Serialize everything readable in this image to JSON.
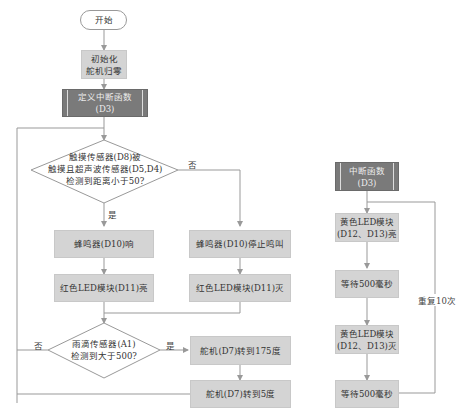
{
  "main_flow": {
    "start": "开始",
    "init": [
      "初始化",
      "舵机归零"
    ],
    "define_interrupt": [
      "定义中断函数",
      "(D3)"
    ],
    "decision1": [
      "触摸传感器(D8)被",
      "触摸且超声波传感器(D5,D4)",
      "检测到距离小于50?"
    ],
    "decision1_yes": "是",
    "decision1_no": "否",
    "buzzer_on": "蜂鸣器(D10)响",
    "buzzer_off": "蜂鸣器(D10)停止鸣叫",
    "red_led_on": "红色LED模块(D11)亮",
    "red_led_off": "红色LED模块(D11)灭",
    "decision2": [
      "雨滴传感器(A1)",
      "检测到大于500?"
    ],
    "decision2_yes": "是",
    "decision2_no": "否",
    "servo_175": "舵机(D7)转到175度",
    "servo_5": "舵机(D7)转到5度"
  },
  "interrupt_flow": {
    "title": [
      "中断函数",
      "(D3)"
    ],
    "yellow_on": [
      "黄色LED模块",
      "(D12、D13)亮"
    ],
    "wait1": "等待500毫秒",
    "yellow_off": [
      "黄色LED模块",
      "(D12、D13)灭"
    ],
    "wait2": "等待500毫秒",
    "repeat": "重复10次"
  },
  "colors": {
    "process_fill": "#d4d4d4",
    "subroutine_fill": "#7a7a7a",
    "line": "#999999"
  }
}
